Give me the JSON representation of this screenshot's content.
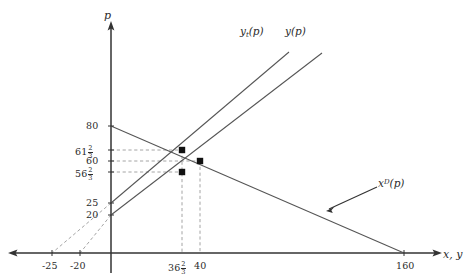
{
  "figure": {
    "axes": {
      "vertical_label": "p",
      "horizontal_label": "x, y"
    },
    "y_ticks": [
      {
        "id": "y80",
        "text": "80",
        "value": 80,
        "px_y": 126
      },
      {
        "id": "y6123",
        "text": "61",
        "frac": "2/3",
        "value": 61.6667,
        "px_y": 150
      },
      {
        "id": "y60",
        "text": "60",
        "value": 60,
        "px_y": 161
      },
      {
        "id": "y5623",
        "text": "56",
        "frac": "2/3",
        "value": 56.6667,
        "px_y": 172
      },
      {
        "id": "y25",
        "text": "25",
        "value": 25,
        "px_y": 203
      },
      {
        "id": "y20",
        "text": "20",
        "value": 20,
        "px_y": 215
      }
    ],
    "x_ticks": [
      {
        "id": "xm25",
        "text": "-25",
        "value": -25,
        "px_x": 52
      },
      {
        "id": "xm20",
        "text": "-20",
        "value": -20,
        "px_x": 80
      },
      {
        "id": "x3623",
        "text": "36",
        "frac": "2/3",
        "value": 36.6667,
        "px_x": 182
      },
      {
        "id": "x40",
        "text": "40",
        "value": 40,
        "px_x": 200
      },
      {
        "id": "x160",
        "text": "160",
        "value": 160,
        "px_x": 404
      }
    ],
    "curves": [
      {
        "id": "demand",
        "label": "x",
        "superscript": "D",
        "label_suffix": "(p)",
        "intercept_p": 80,
        "intercept_x": 160,
        "color": "#555555"
      },
      {
        "id": "supply_tax",
        "label": "y",
        "subscript": "t",
        "label_suffix": "(p)",
        "intercept_p": 25,
        "color": "#555555"
      },
      {
        "id": "supply",
        "label": "y",
        "label_suffix": "(p)",
        "intercept_p": 20,
        "color": "#555555"
      }
    ],
    "points": [
      {
        "id": "tax-equilibrium",
        "x": 36.6667,
        "p": 61.6667,
        "px_x": 182,
        "px_y": 150
      },
      {
        "id": "free-equilibrium",
        "x": 40,
        "p": 60,
        "px_x": 200,
        "px_y": 161
      },
      {
        "id": "supplier-price",
        "x": 36.6667,
        "p": 56.6667,
        "px_x": 182,
        "px_y": 172
      }
    ],
    "colors": {
      "axis": "#333333",
      "curve": "#555555",
      "dashed": "#999999",
      "point": "#111111",
      "text": "#2b2b2b",
      "background": "#ffffff"
    }
  }
}
